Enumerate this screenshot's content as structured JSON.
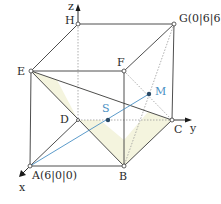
{
  "diagram": {
    "colors": {
      "edge": "#3a3a3a",
      "hidden_edge": "#9a9a9a",
      "accent_line": "#4a90c4",
      "shade": "#f3f3dc"
    },
    "axes": {
      "x": "x",
      "y": "y",
      "z": "z"
    },
    "points": {
      "A": "A(6|0|0)",
      "B": "B",
      "C": "C",
      "D": "D",
      "E": "E",
      "F": "F",
      "G": "G(0|6|6)",
      "H": "H",
      "S": "S",
      "M": "M"
    }
  }
}
